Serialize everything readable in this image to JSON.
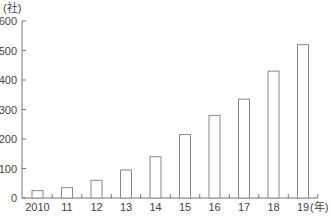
{
  "chart_data": {
    "type": "bar",
    "title": "",
    "categories": [
      "2010",
      "11",
      "12",
      "13",
      "14",
      "15",
      "16",
      "17",
      "18",
      "19"
    ],
    "values": [
      25,
      35,
      60,
      95,
      140,
      215,
      280,
      335,
      430,
      520
    ],
    "xlabel": "(年)",
    "ylabel": "(社)",
    "ylim": [
      0,
      600
    ],
    "yticks": [
      0,
      100,
      200,
      300,
      400,
      500,
      600
    ],
    "grid": false,
    "legend": null,
    "bar_style": "outlined, white fill"
  },
  "colors": {
    "axis": "#777777",
    "bar_stroke": "#888888",
    "bar_fill": "#ffffff",
    "text": "#444444"
  }
}
